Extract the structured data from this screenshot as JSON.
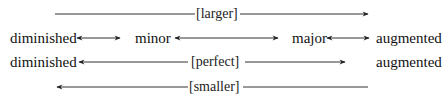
{
  "diagram": {
    "rows": [
      {
        "id": "larger",
        "label": "[larger]",
        "direction": "right"
      },
      {
        "id": "qualities",
        "items": [
          "diminished",
          "minor",
          "major",
          "augmented"
        ]
      },
      {
        "id": "perfect",
        "left": "diminished",
        "label": "[perfect]",
        "right": "augmented"
      },
      {
        "id": "smaller",
        "label": "[smaller]",
        "direction": "left"
      }
    ],
    "colors": {
      "line": "#333333",
      "text": "#111111",
      "background": "#ffffff"
    }
  }
}
